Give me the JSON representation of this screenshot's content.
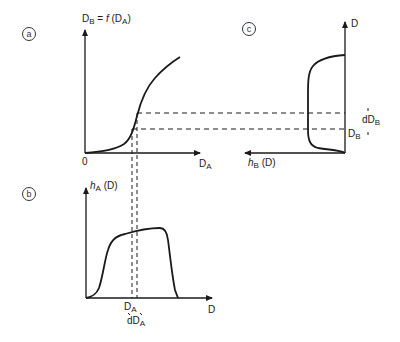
{
  "figure": {
    "panel_a": {
      "marker": "a",
      "y_axis_label_main": "D",
      "y_axis_label_sub": "B",
      "y_axis_label_eq": " = ",
      "y_axis_label_func": "f",
      "y_axis_label_arg_main": " (D",
      "y_axis_label_arg_sub": "A",
      "y_axis_label_arg_close": ")",
      "origin_label": "0",
      "x_axis_label_main": "D",
      "x_axis_label_sub": "A"
    },
    "panel_b": {
      "marker": "b",
      "y_axis_label_func": "h",
      "y_axis_label_sub": "A",
      "y_axis_label_arg": " (D)",
      "x_axis_label": "D",
      "tick_label_main": "D",
      "tick_label_sub": "A",
      "interval_label_main": "dD",
      "interval_label_sub": "A"
    },
    "panel_c": {
      "marker": "c",
      "y_axis_label": "D",
      "x_axis_label_func": "h",
      "x_axis_label_sub": "B",
      "x_axis_label_arg": " (D)",
      "tick_label_main": "D",
      "tick_label_sub": "B",
      "interval_label_main": "dD",
      "interval_label_sub": "B"
    },
    "line_color": "#1a1a1a"
  }
}
